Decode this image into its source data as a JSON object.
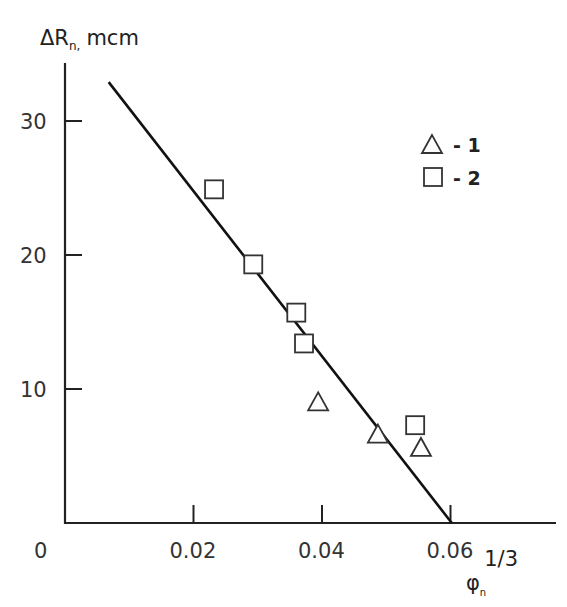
{
  "chart_data": {
    "type": "scatter",
    "title": "",
    "xlabel": "φn^1/3",
    "xlabel_base": "φ",
    "xlabel_sub": "n",
    "xlabel_sup": "1/3",
    "ylabel": "ΔRn, mcm",
    "ylabel_base": "ΔR",
    "ylabel_sub": "n,",
    "ylabel_unit": "mcm",
    "xlim": [
      0,
      0.075
    ],
    "ylim": [
      0,
      35
    ],
    "x_ticks": [
      0.02,
      0.04,
      0.06
    ],
    "x_tick_labels": [
      "0",
      "0.02",
      "0.04",
      "0.06"
    ],
    "y_ticks": [
      10,
      20,
      30
    ],
    "y_tick_labels": [
      "10",
      "20",
      "30"
    ],
    "grid": false,
    "legend_position": "upper right",
    "series": [
      {
        "name": "1",
        "marker": "triangle",
        "x": [
          0.0394,
          0.0487,
          0.0554
        ],
        "y": [
          9.0,
          6.6,
          5.6
        ]
      },
      {
        "name": "2",
        "marker": "square",
        "x": [
          0.0232,
          0.0293,
          0.036,
          0.0372,
          0.0545
        ],
        "y": [
          24.9,
          19.3,
          15.7,
          13.4,
          7.3
        ]
      }
    ],
    "fit_line": {
      "x": [
        0.0068,
        0.0602
      ],
      "y": [
        32.9,
        0.0
      ]
    }
  },
  "legend": {
    "items": [
      {
        "marker": "triangle",
        "label": "- 1"
      },
      {
        "marker": "square",
        "label": "- 2"
      }
    ]
  },
  "colors": {
    "axis": "#222222",
    "marker": "#333333",
    "line": "#111111"
  }
}
